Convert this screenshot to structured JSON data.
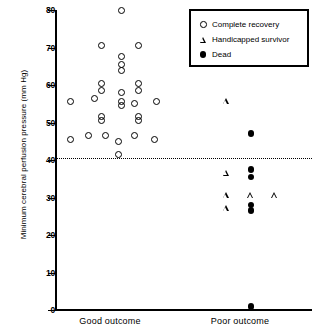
{
  "chart_data": {
    "type": "scatter",
    "title": "",
    "xlabel": "",
    "ylabel": "Minimum cerebral perfusion pressure (mm Hg)",
    "ylim": [
      0,
      80
    ],
    "yticks": [
      0,
      10,
      20,
      30,
      40,
      50,
      60,
      70,
      80
    ],
    "ytick_labels": [
      "0",
      "10",
      "20",
      "30",
      "40",
      "50",
      "60",
      "70",
      "80"
    ],
    "grid": false,
    "categories": [
      "Good outcome",
      "Poor outcome"
    ],
    "legend_position": "top-right",
    "annotations": [
      {
        "name": "threshold-line",
        "type": "hline",
        "y": 40.5,
        "style": "dotted"
      }
    ],
    "series": [
      {
        "name": "Complete recovery",
        "marker": "open-circle",
        "color": "#000000",
        "points": [
          {
            "group": "Good outcome",
            "jitter": 0.1,
            "y": 80.0
          },
          {
            "group": "Good outcome",
            "jitter": -0.08,
            "y": 70.5
          },
          {
            "group": "Good outcome",
            "jitter": 0.26,
            "y": 70.5
          },
          {
            "group": "Good outcome",
            "jitter": 0.1,
            "y": 67.5
          },
          {
            "group": "Good outcome",
            "jitter": 0.1,
            "y": 65.5
          },
          {
            "group": "Good outcome",
            "jitter": 0.1,
            "y": 64.0
          },
          {
            "group": "Good outcome",
            "jitter": -0.08,
            "y": 60.5
          },
          {
            "group": "Good outcome",
            "jitter": 0.26,
            "y": 60.5
          },
          {
            "group": "Good outcome",
            "jitter": -0.08,
            "y": 58.5
          },
          {
            "group": "Good outcome",
            "jitter": 0.26,
            "y": 58.5
          },
          {
            "group": "Good outcome",
            "jitter": 0.1,
            "y": 58.0
          },
          {
            "group": "Good outcome",
            "jitter": -0.14,
            "y": 56.5
          },
          {
            "group": "Good outcome",
            "jitter": -0.36,
            "y": 55.5
          },
          {
            "group": "Good outcome",
            "jitter": 0.1,
            "y": 55.5
          },
          {
            "group": "Good outcome",
            "jitter": 0.22,
            "y": 55.0
          },
          {
            "group": "Good outcome",
            "jitter": 0.42,
            "y": 55.5
          },
          {
            "group": "Good outcome",
            "jitter": 0.1,
            "y": 54.5
          },
          {
            "group": "Good outcome",
            "jitter": -0.08,
            "y": 51.5
          },
          {
            "group": "Good outcome",
            "jitter": -0.08,
            "y": 50.5
          },
          {
            "group": "Good outcome",
            "jitter": 0.26,
            "y": 51.5
          },
          {
            "group": "Good outcome",
            "jitter": 0.26,
            "y": 50.5
          },
          {
            "group": "Good outcome",
            "jitter": -0.36,
            "y": 45.5
          },
          {
            "group": "Good outcome",
            "jitter": -0.2,
            "y": 46.5
          },
          {
            "group": "Good outcome",
            "jitter": -0.04,
            "y": 46.5
          },
          {
            "group": "Good outcome",
            "jitter": 0.08,
            "y": 45.0
          },
          {
            "group": "Good outcome",
            "jitter": 0.22,
            "y": 46.5
          },
          {
            "group": "Good outcome",
            "jitter": 0.4,
            "y": 45.5
          },
          {
            "group": "Good outcome",
            "jitter": 0.08,
            "y": 41.5
          }
        ]
      },
      {
        "name": "Handicapped survivor",
        "marker": "open-triangle",
        "color": "#000000",
        "points": [
          {
            "group": "Poor outcome",
            "jitter": -0.12,
            "y": 55.5
          },
          {
            "group": "Poor outcome",
            "jitter": -0.12,
            "y": 36.5
          },
          {
            "group": "Poor outcome",
            "jitter": -0.12,
            "y": 30.5
          },
          {
            "group": "Poor outcome",
            "jitter": 0.1,
            "y": 30.5
          },
          {
            "group": "Poor outcome",
            "jitter": 0.32,
            "y": 30.5
          },
          {
            "group": "Poor outcome",
            "jitter": -0.12,
            "y": 27.0
          }
        ]
      },
      {
        "name": "Dead",
        "marker": "filled-circle",
        "color": "#000000",
        "points": [
          {
            "group": "Poor outcome",
            "jitter": 0.1,
            "y": 47.0
          },
          {
            "group": "Poor outcome",
            "jitter": 0.1,
            "y": 37.5
          },
          {
            "group": "Poor outcome",
            "jitter": 0.1,
            "y": 35.5
          },
          {
            "group": "Poor outcome",
            "jitter": 0.1,
            "y": 28.0
          },
          {
            "group": "Poor outcome",
            "jitter": 0.1,
            "y": 26.5
          },
          {
            "group": "Poor outcome",
            "jitter": 0.1,
            "y": 1.0
          }
        ]
      }
    ]
  },
  "axes": {
    "y_title": "Minimum cerebral perfusion pressure (mm Hg)",
    "tick_labels": [
      "80",
      "70",
      "60",
      "50",
      "40",
      "30",
      "20",
      "10",
      "0"
    ],
    "x_labels": [
      "Good outcome",
      "Poor outcome"
    ]
  },
  "legend": {
    "entries": [
      {
        "symbol": "open-circle",
        "label": "Complete recovery"
      },
      {
        "symbol": "open-triangle",
        "label": "Handicapped survivor"
      },
      {
        "symbol": "filled-circle",
        "label": "Dead"
      }
    ]
  }
}
